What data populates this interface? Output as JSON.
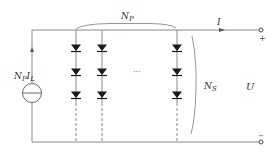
{
  "diagram": {
    "type": "circuit",
    "labels": {
      "source_current": {
        "main": "N",
        "sub1": "P",
        "mid": "I",
        "sub2": "L"
      },
      "parallel_count": {
        "main": "N",
        "sub": "P"
      },
      "series_count": {
        "main": "N",
        "sub": "S"
      },
      "output_current": "I",
      "output_voltage": "U",
      "terminal_plus": "+",
      "terminal_minus": "−",
      "ellipsis": "···"
    },
    "diode_columns": 3,
    "diodes_per_column_visible": 3,
    "colors": {
      "wire": "#888888",
      "diode": "#1a1a1a",
      "text": "#333333"
    }
  }
}
